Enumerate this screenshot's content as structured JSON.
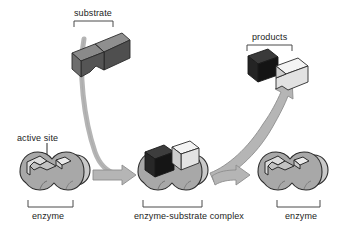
{
  "diagram": {
    "background_color": "#ffffff",
    "text_color": "#1c1c1c",
    "labels": {
      "substrate": "substrate",
      "products": "products",
      "active_site": "active site",
      "enzyme_left": "enzyme",
      "enzyme_substrate_complex": "enzyme-substrate complex",
      "enzyme_right": "enzyme"
    },
    "palette": {
      "enzyme_body": "#a8a8a8",
      "enzyme_body_light": "#c9c9c9",
      "enzyme_outline": "#2b2b2b",
      "substrate_dark": "#4a4a4a",
      "substrate_darker": "#3a3a3a",
      "product_black": "#1a1a1a",
      "product_white": "#ededed",
      "arrow_fill": "#b5b5b5",
      "arrow_outline": "#8d8d8d",
      "bracket": "#4a4a4a"
    },
    "stages": [
      {
        "name": "enzyme",
        "caption": "enzyme",
        "state": "free enzyme with empty active site"
      },
      {
        "name": "enzyme-substrate-complex",
        "caption": "enzyme-substrate complex",
        "state": "substrate bound in active site"
      },
      {
        "name": "enzyme-regenerated",
        "caption": "enzyme",
        "state": "free enzyme released unchanged"
      }
    ],
    "molecules": [
      {
        "name": "substrate",
        "caption": "substrate",
        "state": "intact, single bent block"
      },
      {
        "name": "products",
        "caption": "products",
        "state": "cleaved into two separate blocks"
      }
    ],
    "arrows": [
      {
        "name": "substrate-binding-arrow",
        "from": "substrate",
        "to": "enzyme-substrate-complex"
      },
      {
        "name": "product-release-arrow",
        "from": "enzyme-substrate-complex",
        "to": "products"
      },
      {
        "name": "enzyme-regeneration-arrow",
        "from": "enzyme-substrate-complex",
        "to": "enzyme-regenerated"
      }
    ]
  }
}
